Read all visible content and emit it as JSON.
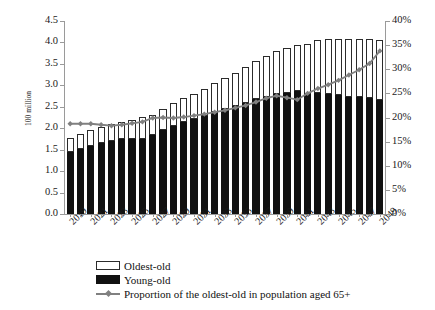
{
  "chart_data": {
    "type": "bar",
    "title": "",
    "subtitle": "",
    "xlabel": "",
    "ylabel": "100 million",
    "y2label": "",
    "ylim": [
      0,
      4.5
    ],
    "y2lim": [
      0,
      0.4
    ],
    "grid": false,
    "legend_position": "bottom-left",
    "stacked": true,
    "x": [
      2019,
      2020,
      2021,
      2022,
      2023,
      2024,
      2025,
      2026,
      2027,
      2028,
      2029,
      2030,
      2031,
      2032,
      2033,
      2034,
      2035,
      2036,
      2037,
      2038,
      2039,
      2040,
      2041,
      2042,
      2043,
      2044,
      2045,
      2046,
      2047,
      2048,
      2049
    ],
    "categories": [
      "2019",
      "2020",
      "2021",
      "2022",
      "2023",
      "2024",
      "2025",
      "2026",
      "2027",
      "2028",
      "2029",
      "2030",
      "2031",
      "2032",
      "2033",
      "2034",
      "2035",
      "2036",
      "2037",
      "2038",
      "2039",
      "2040",
      "2041",
      "2042",
      "2043",
      "2044",
      "2045",
      "2046",
      "2047",
      "2048",
      "2049"
    ],
    "x_tick_labels": [
      "2019",
      "2021",
      "2023",
      "2025",
      "2027",
      "2029",
      "2031",
      "2033",
      "2035",
      "2037",
      "2039",
      "2041",
      "2043",
      "2045",
      "2047",
      "2049"
    ],
    "y_tick_labels": [
      "0.0",
      "0.5",
      "1.0",
      "1.5",
      "2.0",
      "2.5",
      "3.0",
      "3.5",
      "4.0",
      "4.5"
    ],
    "y2_tick_labels": [
      "0%",
      "5%",
      "10%",
      "15%",
      "20%",
      "25%",
      "30%",
      "35%",
      "40%"
    ],
    "series": [
      {
        "name": "Young-old",
        "axis": "left",
        "fill": "#111111",
        "values": [
          1.45,
          1.52,
          1.59,
          1.66,
          1.71,
          1.74,
          1.76,
          1.76,
          1.84,
          1.96,
          2.05,
          2.14,
          2.21,
          2.29,
          2.37,
          2.44,
          2.52,
          2.6,
          2.68,
          2.74,
          2.79,
          2.83,
          2.87,
          2.8,
          2.81,
          2.79,
          2.77,
          2.74,
          2.73,
          2.7,
          2.66
        ]
      },
      {
        "name": "Oldest-old",
        "axis": "left",
        "fill": "#ffffff",
        "values": [
          0.33,
          0.35,
          0.36,
          0.37,
          0.38,
          0.4,
          0.44,
          0.5,
          0.47,
          0.49,
          0.53,
          0.56,
          0.6,
          0.63,
          0.68,
          0.72,
          0.77,
          0.83,
          0.89,
          0.95,
          1.01,
          1.04,
          1.06,
          1.17,
          1.25,
          1.29,
          1.31,
          1.34,
          1.35,
          1.38,
          1.39
        ]
      },
      {
        "name": "Proportion of the oldest-old in population aged 65+",
        "axis": "right",
        "type": "line",
        "color": "#808080",
        "marker": "diamond",
        "values": [
          0.187,
          0.187,
          0.187,
          0.185,
          0.183,
          0.185,
          0.188,
          0.191,
          0.199,
          0.2,
          0.199,
          0.201,
          0.204,
          0.207,
          0.211,
          0.215,
          0.22,
          0.225,
          0.232,
          0.24,
          0.245,
          0.241,
          0.237,
          0.25,
          0.26,
          0.268,
          0.277,
          0.288,
          0.299,
          0.312,
          0.338
        ]
      }
    ],
    "stacked_totals": [
      1.78,
      1.87,
      1.95,
      2.03,
      2.09,
      2.14,
      2.2,
      2.26,
      2.31,
      2.45,
      2.58,
      2.7,
      2.81,
      2.92,
      3.05,
      3.16,
      3.29,
      3.43,
      3.57,
      3.69,
      3.8,
      3.87,
      3.93,
      3.97,
      4.06,
      4.08,
      4.08,
      4.08,
      4.08,
      4.08,
      4.05
    ]
  },
  "legend": {
    "items": [
      {
        "label": "Oldest-old",
        "key": "swatch-outline"
      },
      {
        "label": "Young-old",
        "key": "swatch-filled"
      },
      {
        "label": "Proportion of the oldest-old in population aged 65+",
        "key": "line-marker"
      }
    ]
  },
  "colors": {
    "young_old": "#111111",
    "oldest_old": "#ffffff",
    "line": "#808080",
    "axis": "#9a9a9a",
    "text": "#1a1a1a",
    "background": "#ffffff"
  }
}
